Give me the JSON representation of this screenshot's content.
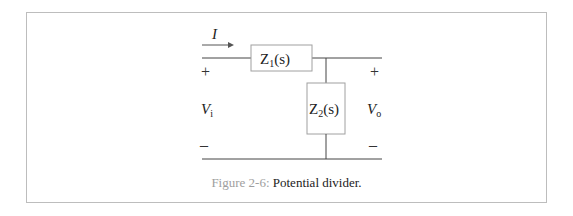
{
  "figure": {
    "caption_label": "Figure 2-6:",
    "caption_text": " Potential divider."
  },
  "circuit": {
    "current_label": "I",
    "z1_label": "Z",
    "z1_sub": "1",
    "z1_arg": "(s)",
    "z2_label": "Z",
    "z2_sub": "2",
    "z2_arg": "(s)",
    "vin_label": "V",
    "vin_sub": "i",
    "vout_label": "V",
    "vout_sub": "o",
    "plus": "+",
    "minus": "–"
  },
  "colors": {
    "wire": "#444444",
    "box_border": "#a0a0a0",
    "frame_border": "#bdbdbd",
    "caption_label": "#9e9e9e"
  }
}
